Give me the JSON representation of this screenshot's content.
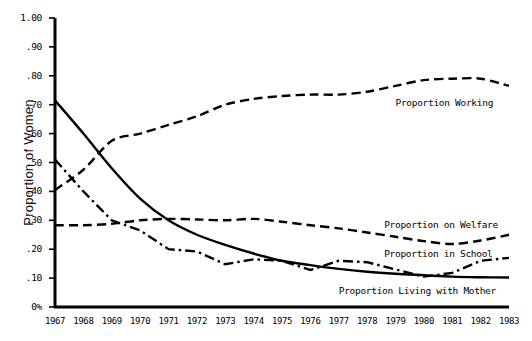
{
  "chart_data": {
    "type": "line",
    "title": "",
    "xlabel": "",
    "ylabel": "Proportion of Women",
    "x": [
      1967,
      1968,
      1969,
      1970,
      1971,
      1972,
      1973,
      1974,
      1975,
      1976,
      1977,
      1978,
      1979,
      1980,
      1981,
      1982,
      1983
    ],
    "xtick_labels": [
      "1967",
      "1968",
      "1969",
      "1970",
      "1971",
      "1972",
      "1973",
      "1974",
      "1975",
      "1976",
      "1977",
      "1978",
      "1979",
      "1980",
      "1981",
      "1982",
      "1983"
    ],
    "ytick_labels": [
      "0%",
      ".10",
      ".20",
      ".30",
      ".40",
      ".50",
      ".60",
      ".70",
      ".80",
      ".90",
      "1.00"
    ],
    "ytick_values": [
      0,
      0.1,
      0.2,
      0.3,
      0.4,
      0.5,
      0.6,
      0.7,
      0.8,
      0.9,
      1.0
    ],
    "ylim": [
      0,
      1.0
    ],
    "xlim": [
      1967,
      1983
    ],
    "grid": false,
    "legend_position": "inline-right",
    "series": [
      {
        "name": "Proportion Working",
        "label": "Proportion Working",
        "style": "dashed",
        "color": "#000000",
        "label_x": 1979.0,
        "label_y": 0.705,
        "values": [
          0.405,
          0.475,
          0.575,
          0.6,
          0.63,
          0.66,
          0.7,
          0.72,
          0.73,
          0.735,
          0.735,
          0.745,
          0.765,
          0.785,
          0.79,
          0.79,
          0.765
        ]
      },
      {
        "name": "Proportion on Welfare",
        "label": "Proportion on Welfare",
        "style": "dashed",
        "color": "#000000",
        "label_x": 1978.6,
        "label_y": 0.283,
        "values": [
          0.283,
          0.283,
          0.288,
          0.3,
          0.305,
          0.303,
          0.3,
          0.305,
          0.295,
          0.283,
          0.272,
          0.258,
          0.243,
          0.228,
          0.218,
          0.23,
          0.25
        ]
      },
      {
        "name": "Proportion in School",
        "label": "Proportion in School",
        "style": "dashdot",
        "color": "#000000",
        "label_x": 1978.6,
        "label_y": 0.183,
        "values": [
          0.51,
          0.4,
          0.3,
          0.265,
          0.2,
          0.192,
          0.148,
          0.165,
          0.16,
          0.128,
          0.16,
          0.155,
          0.13,
          0.105,
          0.118,
          0.16,
          0.17
        ]
      },
      {
        "name": "Proportion Living with Mother",
        "label": "Proportion Living with Mother",
        "style": "solid",
        "color": "#000000",
        "label_x": 1977.0,
        "label_y": 0.055,
        "values": [
          0.715,
          0.6,
          0.48,
          0.375,
          0.3,
          0.25,
          0.215,
          0.185,
          0.16,
          0.145,
          0.132,
          0.122,
          0.115,
          0.11,
          0.105,
          0.103,
          0.102
        ]
      }
    ]
  }
}
